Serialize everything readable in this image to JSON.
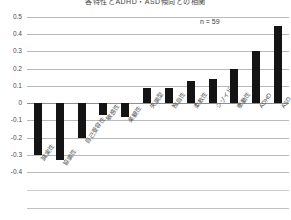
{
  "chart_data": {
    "type": "bar",
    "title": "各特性とADHD・ASD傾向との相関",
    "xlabel": "",
    "ylabel": "",
    "ylim": [
      -0.4,
      0.5
    ],
    "yticks": [
      "0.5",
      "0.4",
      "0.3",
      "0.2",
      "0.1",
      "0",
      "-0.1",
      "-0.2",
      "-0.3",
      "-0.4"
    ],
    "ytick_values": [
      0.5,
      0.4,
      0.3,
      0.2,
      0.1,
      0,
      -0.1,
      -0.2,
      -0.3,
      -0.4
    ],
    "grid": true,
    "legend": "none",
    "annotation": "n = 59",
    "categories": [
      "誠実性",
      "協調性",
      "自己受容性",
      "敏感性",
      "楽観性",
      "失調型",
      "独自性",
      "柔軟性",
      "シゾイド",
      "衝動性",
      "ADHD",
      "ASD"
    ],
    "values": [
      -0.3,
      -0.33,
      -0.2,
      -0.07,
      -0.08,
      0.09,
      0.09,
      0.13,
      0.14,
      0.2,
      0.3,
      0.45
    ],
    "bar_color": "#141414"
  },
  "colors": {
    "bar": "#141414",
    "grid": "#b9b9b9",
    "zero_axis": "#8e8e8e",
    "text": "#4a4a4a",
    "background": "#ffffff"
  }
}
